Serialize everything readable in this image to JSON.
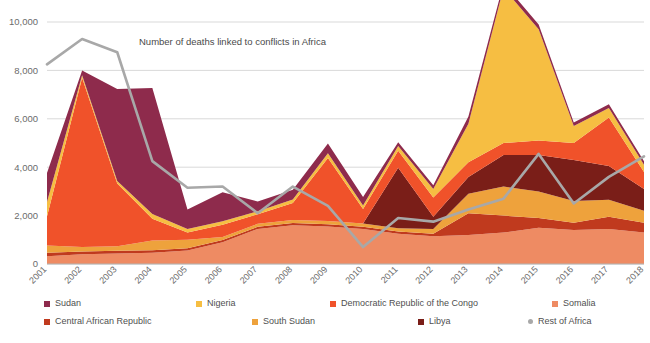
{
  "chart_data": {
    "type": "area",
    "stacked": true,
    "title": "Number of deaths linked to conflicts in Africa",
    "xlabel": "",
    "ylabel": "",
    "ylim": [
      0,
      10000
    ],
    "yticks": [
      0,
      2000,
      4000,
      6000,
      8000,
      10000
    ],
    "ytick_labels": [
      "0",
      "2,000",
      "4,000",
      "6,000",
      "8,000",
      "10,000"
    ],
    "grid": true,
    "legend_position": "bottom",
    "categories": [
      "2001",
      "2002",
      "2003",
      "2004",
      "2005",
      "2006",
      "2007",
      "2008",
      "2009",
      "2010",
      "2011",
      "2012",
      "2013",
      "2014",
      "2015",
      "2016",
      "2017",
      "2018"
    ],
    "series": [
      {
        "name": "Somalia",
        "color": "#EE8B63",
        "type": "area",
        "values": [
          320,
          400,
          430,
          470,
          560,
          900,
          1450,
          1600,
          1550,
          1450,
          1250,
          1150,
          1200,
          1300,
          1500,
          1400,
          1450,
          1300
        ]
      },
      {
        "name": "Central African Republic",
        "color": "#C03A1E",
        "type": "area",
        "values": [
          140,
          120,
          120,
          100,
          90,
          90,
          90,
          90,
          90,
          90,
          90,
          100,
          900,
          700,
          400,
          300,
          500,
          400
        ]
      },
      {
        "name": "South Sudan",
        "color": "#EEA23C",
        "type": "area",
        "values": [
          300,
          180,
          180,
          400,
          350,
          130,
          120,
          130,
          140,
          130,
          140,
          200,
          800,
          1200,
          1100,
          900,
          700,
          500
        ]
      },
      {
        "name": "Libya",
        "color": "#7A1E18",
        "type": "area",
        "values": [
          0,
          0,
          0,
          0,
          0,
          0,
          0,
          0,
          0,
          0,
          2500,
          500,
          700,
          1300,
          1500,
          1700,
          1400,
          900
        ]
      },
      {
        "name": "Democratic Republic of the Congo",
        "color": "#F0522A",
        "type": "area",
        "values": [
          1200,
          7000,
          2600,
          900,
          300,
          500,
          400,
          700,
          2600,
          600,
          700,
          800,
          600,
          500,
          600,
          700,
          2000,
          700
        ]
      },
      {
        "name": "Nigeria",
        "color": "#F6BE42",
        "type": "area",
        "values": [
          600,
          100,
          100,
          200,
          150,
          150,
          120,
          150,
          200,
          150,
          200,
          350,
          1600,
          6400,
          4600,
          700,
          400,
          300
        ]
      },
      {
        "name": "Sudan",
        "color": "#8E2B4C",
        "type": "area",
        "values": [
          1200,
          200,
          3800,
          5200,
          800,
          1200,
          400,
          400,
          400,
          350,
          150,
          150,
          300,
          200,
          200,
          150,
          150,
          150
        ]
      },
      {
        "name": "Rest of Africa",
        "color": "#A8A8A8",
        "type": "line",
        "values": [
          8250,
          9300,
          8750,
          4250,
          3150,
          3200,
          2100,
          3200,
          2400,
          700,
          1900,
          1750,
          2250,
          2700,
          4550,
          2500,
          3600,
          4450
        ]
      }
    ]
  },
  "legend": {
    "rows": [
      [
        {
          "label": "Sudan",
          "color": "#8E2B4C",
          "shape": "square",
          "x": 44
        },
        {
          "label": "Nigeria",
          "color": "#F6BE42",
          "shape": "square",
          "x": 196
        },
        {
          "label": "Democratic Republic of the Congo",
          "color": "#F0522A",
          "shape": "square",
          "x": 330
        },
        {
          "label": "Somalia",
          "color": "#EE8B63",
          "shape": "square",
          "x": 552
        }
      ],
      [
        {
          "label": "Central African Republic",
          "color": "#C03A1E",
          "shape": "square",
          "x": 44
        },
        {
          "label": "South Sudan",
          "color": "#EEA23C",
          "shape": "square",
          "x": 252
        },
        {
          "label": "Libya",
          "color": "#7A1E18",
          "shape": "square",
          "x": 418
        },
        {
          "label": "Rest of Africa",
          "color": "#A8A8A8",
          "shape": "dot",
          "x": 528
        }
      ]
    ]
  }
}
